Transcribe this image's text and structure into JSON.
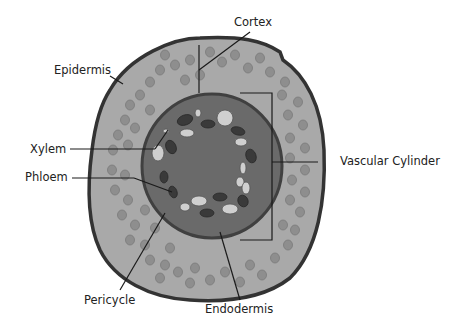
{
  "colors": {
    "outline": "#333333",
    "cortex_fill": "#a9a9a9",
    "cortex_cell": "#8e8e8e",
    "stele_fill": "#6a6a6a",
    "stele_border": "#404040",
    "phloem": "#3a3a3a",
    "xylem": "#cfcfcf",
    "leader": "#1a1a1a"
  },
  "labels": {
    "cortex": "Cortex",
    "epidermis": "Epidermis",
    "xylem": "Xylem",
    "phloem": "Phloem",
    "vascular_cylinder": "Vascular Cylinder",
    "pericycle": "Pericycle",
    "endodermis": "Endodermis"
  }
}
